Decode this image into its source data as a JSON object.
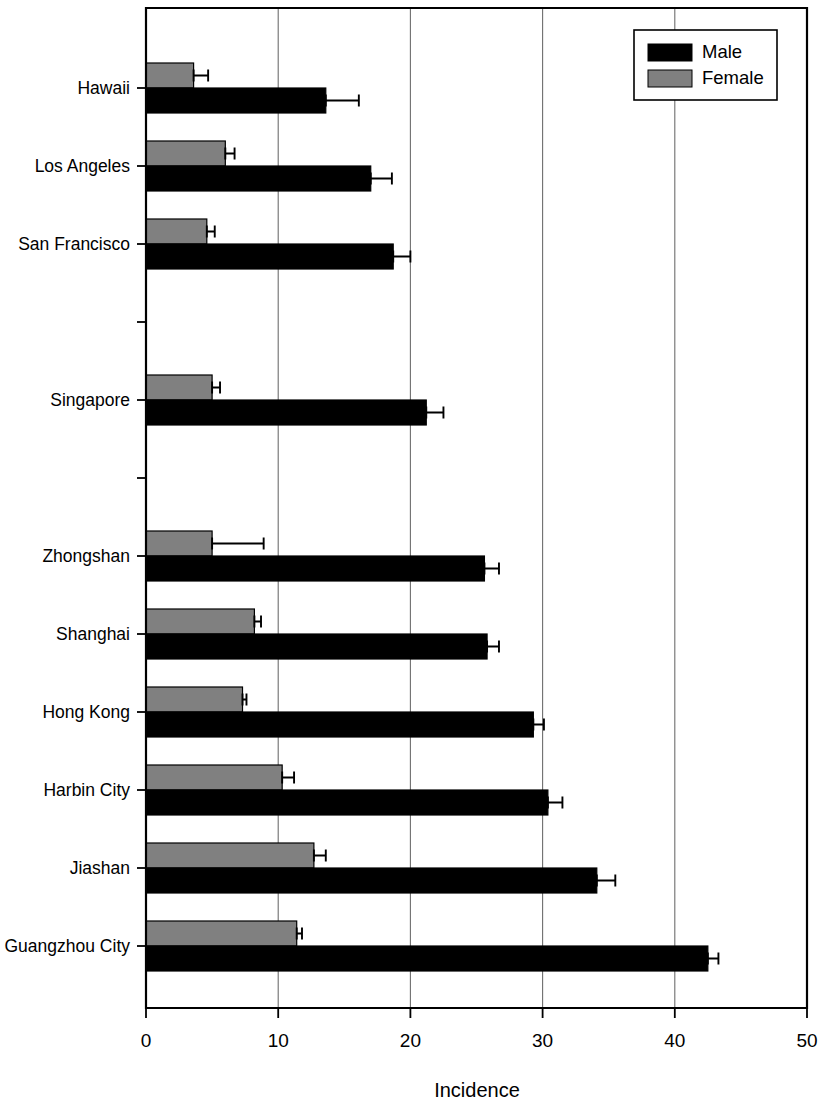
{
  "chart_data": {
    "type": "bar",
    "orientation": "horizontal",
    "title": "",
    "xlabel": "Incidence",
    "ylabel": "",
    "xlim": [
      0,
      50
    ],
    "xticks": [
      0,
      10,
      20,
      30,
      40,
      50
    ],
    "xtick_labels": [
      "0",
      "10",
      "20",
      "30",
      "40",
      "50"
    ],
    "grid": "vertical",
    "legend_position": "top-right",
    "categories": [
      "Hawaii",
      "Los Angeles",
      "San Francisco",
      "",
      "Singapore",
      "",
      "Zhongshan",
      "Shanghai",
      "Hong Kong",
      "Harbin City",
      "Jiashan",
      "Guangzhou City"
    ],
    "series": [
      {
        "name": "Male",
        "color": "#000000",
        "values": [
          13.6,
          17.0,
          18.7,
          null,
          21.2,
          null,
          25.6,
          25.8,
          29.3,
          30.4,
          34.1,
          42.5
        ],
        "errors": [
          2.5,
          1.6,
          1.3,
          null,
          1.3,
          null,
          1.1,
          0.9,
          0.8,
          1.1,
          1.4,
          0.8
        ]
      },
      {
        "name": "Female",
        "color": "#808080",
        "values": [
          3.6,
          6.0,
          4.6,
          null,
          5.0,
          null,
          5.0,
          8.2,
          7.3,
          10.3,
          12.7,
          11.4
        ],
        "errors": [
          1.1,
          0.7,
          0.6,
          null,
          0.6,
          null,
          3.9,
          0.5,
          0.3,
          0.9,
          0.9,
          0.4
        ]
      }
    ]
  },
  "legend": {
    "entries": [
      {
        "label": "Male",
        "color": "#000000"
      },
      {
        "label": "Female",
        "color": "#808080"
      }
    ]
  },
  "axis": {
    "x_title": "Incidence",
    "x_tick_labels": [
      "0",
      "10",
      "20",
      "30",
      "40",
      "50"
    ],
    "y_tick_labels": [
      "Hawaii",
      "Los Angeles",
      "San Francisco",
      "",
      "Singapore",
      "",
      "Zhongshan",
      "Shanghai",
      "Hong Kong",
      "Harbin City",
      "Jiashan",
      "Guangzhou City"
    ]
  }
}
